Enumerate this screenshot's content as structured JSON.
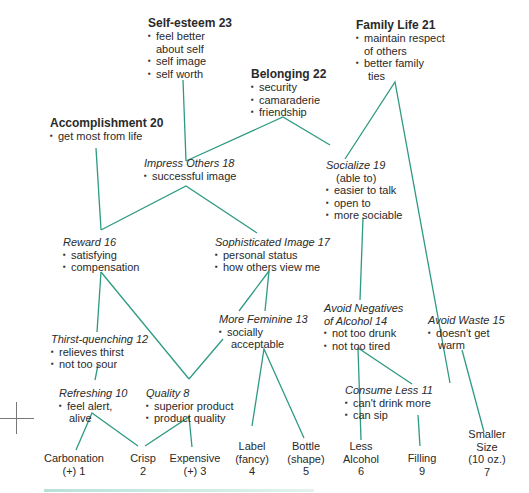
{
  "diagram": {
    "type": "hierarchical value map",
    "line_color": "#2e9a82",
    "values": [
      {
        "id": "self_esteem",
        "title": "Self-esteem 23",
        "bullets": [
          [
            "feel better",
            "about self"
          ],
          [
            "self image"
          ],
          [
            "self worth"
          ]
        ]
      },
      {
        "id": "family_life",
        "title": "Family Life 21",
        "bullets": [
          [
            "maintain respect",
            "of others"
          ],
          [
            "better family",
            "ties"
          ]
        ]
      },
      {
        "id": "belonging",
        "title": "Belonging 22",
        "bullets": [
          [
            "security"
          ],
          [
            "camaraderie"
          ],
          [
            "friendship"
          ]
        ]
      },
      {
        "id": "accomplishment",
        "title": "Accomplishment 20",
        "bullets": [
          [
            "get most from life"
          ]
        ]
      }
    ],
    "consequences": [
      {
        "id": "impress_others",
        "title": "Impress Others 18",
        "bullets": [
          [
            "successful image"
          ]
        ]
      },
      {
        "id": "socialize",
        "title": "Socialize 19",
        "subtitle": "(able to)",
        "bullets": [
          [
            "easier to talk"
          ],
          [
            "open to"
          ],
          [
            "more sociable"
          ]
        ]
      },
      {
        "id": "reward",
        "title": "Reward 16",
        "bullets": [
          [
            "satisfying"
          ],
          [
            "compensation"
          ]
        ]
      },
      {
        "id": "sophisticated_image",
        "title": "Sophisticated Image 17",
        "bullets": [
          [
            "personal status"
          ],
          [
            "how others view me"
          ]
        ]
      },
      {
        "id": "more_feminine",
        "title": "More Feminine 13",
        "bullets": [
          [
            "socially",
            "acceptable"
          ]
        ]
      },
      {
        "id": "avoid_negatives",
        "title_lines": [
          "Avoid Negatives",
          "of Alcohol 14"
        ],
        "bullets": [
          [
            "not too drunk"
          ],
          [
            "not too tired"
          ]
        ]
      },
      {
        "id": "avoid_waste",
        "title": "Avoid Waste 15",
        "bullets": [
          [
            "doesn't get",
            "warm"
          ]
        ]
      },
      {
        "id": "thirst_quenching",
        "title": "Thirst-quenching 12",
        "bullets": [
          [
            "relieves thirst"
          ],
          [
            "not too sour"
          ]
        ]
      },
      {
        "id": "refreshing",
        "title": "Refreshing 10",
        "bullets": [
          [
            "feel alert,",
            "alive"
          ]
        ]
      },
      {
        "id": "quality",
        "title": "Quality 8",
        "bullets": [
          [
            "superior product"
          ],
          [
            "product quality"
          ]
        ]
      },
      {
        "id": "consume_less",
        "title": "Consume Less 11",
        "bullets": [
          [
            "can't drink more"
          ],
          [
            "can sip"
          ]
        ]
      }
    ],
    "attributes": [
      {
        "id": "carbonation",
        "lines": [
          "Carbonation",
          "(+) 1"
        ]
      },
      {
        "id": "crisp",
        "lines": [
          "Crisp",
          "2"
        ]
      },
      {
        "id": "expensive",
        "lines": [
          "Expensive",
          "(+) 3"
        ]
      },
      {
        "id": "label",
        "lines": [
          "Label",
          "(fancy)",
          "4"
        ]
      },
      {
        "id": "bottle",
        "lines": [
          "Bottle",
          "(shape)",
          "5"
        ]
      },
      {
        "id": "less_alcohol",
        "lines": [
          "Less",
          "Alcohol",
          "6"
        ]
      },
      {
        "id": "filling",
        "lines": [
          "Filling",
          "9"
        ]
      },
      {
        "id": "smaller_size",
        "lines": [
          "Smaller",
          "Size",
          "(10 oz.)",
          "7"
        ]
      }
    ]
  }
}
